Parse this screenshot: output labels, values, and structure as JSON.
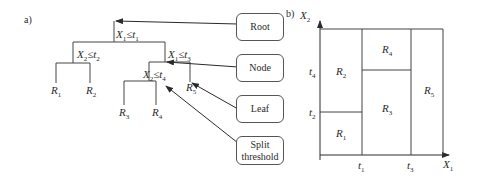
{
  "panels": {
    "a": "a)",
    "b": "b)"
  },
  "tree": {
    "root_split": {
      "var": "X",
      "var_sub": "1",
      "op": "≤",
      "thr": "t",
      "thr_sub": "1"
    },
    "left_split": {
      "var": "X",
      "var_sub": "2",
      "op": "≤",
      "thr": "t",
      "thr_sub": "2"
    },
    "right_split": {
      "var": "X",
      "var_sub": "1",
      "op": "≤",
      "thr": "t",
      "thr_sub": "3"
    },
    "inner_split": {
      "var": "X",
      "var_sub": "2",
      "op": "≤",
      "thr": "t",
      "thr_sub": "4"
    },
    "leaves": [
      {
        "name": "R",
        "sub": "1"
      },
      {
        "name": "R",
        "sub": "2"
      },
      {
        "name": "R",
        "sub": "3"
      },
      {
        "name": "R",
        "sub": "4"
      },
      {
        "name": "R",
        "sub": "5"
      }
    ]
  },
  "legend_boxes": {
    "root": "Root",
    "node": "Node",
    "leaf": "Leaf",
    "split_line1": "Split",
    "split_line2": "threshold"
  },
  "partition": {
    "x_axis": {
      "name": "X",
      "sub": "1"
    },
    "y_axis": {
      "name": "X",
      "sub": "2"
    },
    "x_ticks": [
      {
        "name": "t",
        "sub": "1"
      },
      {
        "name": "t",
        "sub": "3"
      }
    ],
    "y_ticks": [
      {
        "name": "t",
        "sub": "4"
      },
      {
        "name": "t",
        "sub": "2"
      }
    ],
    "regions": [
      {
        "name": "R",
        "sub": "1"
      },
      {
        "name": "R",
        "sub": "2"
      },
      {
        "name": "R",
        "sub": "3"
      },
      {
        "name": "R",
        "sub": "4"
      },
      {
        "name": "R",
        "sub": "5"
      }
    ]
  }
}
